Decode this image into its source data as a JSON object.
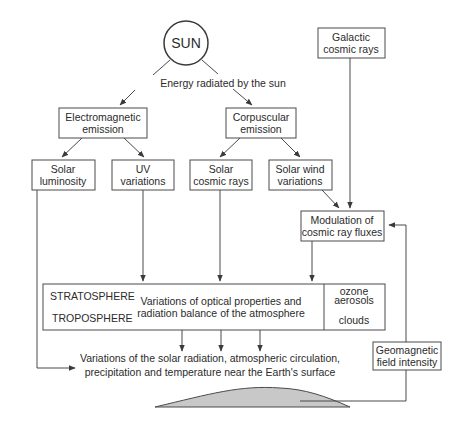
{
  "diagram": {
    "sun": {
      "label": "SUN"
    },
    "energy_label": "Energy radiated by the sun",
    "electromagnetic": {
      "line1": "Electromagnetic",
      "line2": "emission"
    },
    "corpuscular": {
      "line1": "Corpuscular",
      "line2": "emission"
    },
    "galactic": {
      "line1": "Galactic",
      "line2": "cosmic rays"
    },
    "solar_luminosity": {
      "line1": "Solar",
      "line2": "luminosity"
    },
    "uv_variations": {
      "line1": "UV",
      "line2": "variations"
    },
    "solar_cosmic_rays": {
      "line1": "Solar",
      "line2": "cosmic rays"
    },
    "solar_wind": {
      "line1": "Solar wind",
      "line2": "variations"
    },
    "modulation": {
      "line1": "Modulation of",
      "line2": "cosmic ray fluxes"
    },
    "atmosphere": {
      "stratosphere": "STRATOSPHERE",
      "troposphere": "TROPOSPHERE",
      "center_line1": "Variations of optical properties and",
      "center_line2": "radiation balance of the atmosphere",
      "ozone": "ozone",
      "aerosols": "aerosols",
      "clouds": "clouds"
    },
    "surface": {
      "line1": "Variations of the solar radiation, atmospheric circulation,",
      "line2": "precipitation and temperature near the Earth's surface"
    },
    "geomagnetic": {
      "line1": "Geomagnetic",
      "line2": "field intensity"
    },
    "colors": {
      "stroke": "#4a4a4a",
      "text": "#2b2b2b",
      "earth_fill": "#c8c8c8",
      "background": "#ffffff"
    }
  }
}
